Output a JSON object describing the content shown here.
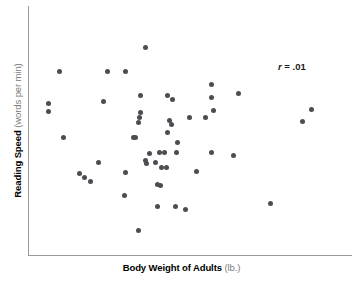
{
  "axes": {
    "x_title_main": "Body Weight of Adults",
    "x_title_unit": "(lb.)",
    "y_title_main": "Reading Speed",
    "y_title_unit": "(words per min)"
  },
  "annotation": {
    "r_symbol": "r",
    "r_text": " = .01"
  },
  "colors": {
    "point": "#4c4c52",
    "axis": "#9a9a9a",
    "title_main": "#000000",
    "title_unit": "#7b7b7b",
    "background": "#ffffff"
  },
  "chart_data": {
    "type": "scatter",
    "title": "",
    "xlabel": "Body Weight of Adults (lb.)",
    "ylabel": "Reading Speed (words per min)",
    "correlation": 0.01,
    "annotations": [
      "r = .01"
    ],
    "grid": false,
    "legend": false,
    "axis_ticks": false,
    "xlim": [
      0,
      100
    ],
    "ylim": [
      0,
      100
    ],
    "note": "Points given in pixel coordinates of the plotting canvas (origin at axes corner, x right, y down from top of figure).",
    "points_px": [
      [
        59,
        71
      ],
      [
        107,
        71
      ],
      [
        125,
        71
      ],
      [
        48,
        103
      ],
      [
        103,
        101
      ],
      [
        145,
        47
      ],
      [
        140,
        95
      ],
      [
        167,
        95
      ],
      [
        172,
        99
      ],
      [
        211,
        84
      ],
      [
        211,
        97
      ],
      [
        140,
        112
      ],
      [
        189,
        117
      ],
      [
        205,
        117
      ],
      [
        213,
        110
      ],
      [
        238,
        93
      ],
      [
        311,
        109
      ],
      [
        302,
        121
      ],
      [
        48,
        111
      ],
      [
        138,
        122
      ],
      [
        63,
        137
      ],
      [
        133,
        137
      ],
      [
        98,
        162
      ],
      [
        145,
        160
      ],
      [
        125,
        172
      ],
      [
        79,
        173
      ],
      [
        84,
        177
      ],
      [
        90,
        181
      ],
      [
        139,
        117
      ],
      [
        169,
        120
      ],
      [
        171,
        124
      ],
      [
        167,
        132
      ],
      [
        177,
        142
      ],
      [
        135,
        137
      ],
      [
        149,
        153
      ],
      [
        159,
        152
      ],
      [
        164,
        152
      ],
      [
        176,
        152
      ],
      [
        211,
        152
      ],
      [
        233,
        155
      ],
      [
        146,
        163
      ],
      [
        155,
        162
      ],
      [
        161,
        167
      ],
      [
        166,
        167
      ],
      [
        196,
        171
      ],
      [
        160,
        185
      ],
      [
        157,
        184
      ],
      [
        124,
        195
      ],
      [
        157,
        206
      ],
      [
        175,
        206
      ],
      [
        185,
        209
      ],
      [
        138,
        230
      ],
      [
        270,
        203
      ]
    ],
    "n_points": 53,
    "x_values": [
      59,
      107,
      125,
      48,
      103,
      145,
      140,
      167,
      172,
      211,
      211,
      140,
      189,
      205,
      213,
      238,
      311,
      302,
      48,
      138,
      63,
      133,
      98,
      145,
      125,
      79,
      84,
      90,
      139,
      169,
      171,
      167,
      177,
      135,
      149,
      159,
      164,
      176,
      211,
      233,
      146,
      155,
      161,
      166,
      196,
      160,
      157,
      124,
      157,
      175,
      185,
      138,
      270
    ],
    "y_values": [
      71,
      71,
      71,
      103,
      101,
      47,
      95,
      95,
      99,
      84,
      97,
      112,
      117,
      117,
      110,
      93,
      109,
      121,
      111,
      122,
      137,
      137,
      162,
      160,
      172,
      173,
      177,
      181,
      117,
      120,
      124,
      132,
      142,
      137,
      153,
      152,
      152,
      152,
      152,
      155,
      163,
      162,
      167,
      167,
      171,
      185,
      184,
      195,
      206,
      206,
      209,
      230,
      203
    ]
  }
}
